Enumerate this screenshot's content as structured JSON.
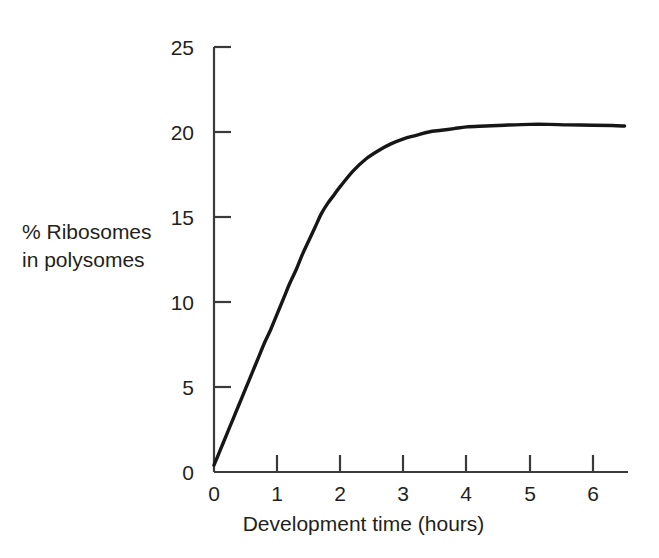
{
  "chart_data": {
    "type": "line",
    "title": "",
    "subtitle": "",
    "xlabel": "Development time (hours)",
    "ylabel": "% Ribosomes in polysomes",
    "ylabel_line1": "% Ribosomes",
    "ylabel_line2": "in polysomes",
    "xlim": [
      0,
      6.5
    ],
    "ylim": [
      0,
      25
    ],
    "xticks": [
      0,
      1,
      2,
      3,
      4,
      5,
      6
    ],
    "yticks": [
      0,
      5,
      10,
      15,
      20,
      25
    ],
    "xtick_labels": [
      "0",
      "1",
      "2",
      "3",
      "4",
      "5",
      "6"
    ],
    "ytick_labels": [
      "0",
      "5",
      "10",
      "15",
      "20",
      "25"
    ],
    "grid": false,
    "legend": "none",
    "line_color": "#161616",
    "axis_color": "#3a3a3a",
    "background_color": "#ffffff",
    "series": [
      {
        "name": "% Ribosomes in polysomes",
        "x": [
          0.0,
          0.1,
          0.2,
          0.3,
          0.4,
          0.5,
          0.6,
          0.7,
          0.8,
          0.9,
          1.0,
          1.1,
          1.2,
          1.3,
          1.4,
          1.5,
          1.6,
          1.7,
          1.8,
          1.9,
          2.0,
          2.2,
          2.4,
          2.6,
          2.8,
          3.0,
          3.2,
          3.4,
          3.6,
          3.8,
          4.0,
          4.3,
          4.6,
          5.0,
          5.3,
          5.6,
          6.0,
          6.3,
          6.5
        ],
        "y": [
          0.4,
          1.3,
          2.2,
          3.1,
          4.0,
          4.9,
          5.8,
          6.7,
          7.6,
          8.4,
          9.3,
          10.2,
          11.1,
          11.9,
          12.8,
          13.6,
          14.4,
          15.2,
          15.8,
          16.3,
          16.8,
          17.7,
          18.4,
          18.9,
          19.3,
          19.6,
          19.8,
          20.0,
          20.1,
          20.2,
          20.3,
          20.35,
          20.4,
          20.45,
          20.45,
          20.42,
          20.4,
          20.38,
          20.35
        ]
      }
    ]
  },
  "axes": {
    "y_tick_positions_px": [
      472,
      387,
      302,
      217,
      132,
      47
    ],
    "x_tick_positions_px": [
      214,
      277,
      340,
      403,
      466,
      530,
      593
    ]
  }
}
